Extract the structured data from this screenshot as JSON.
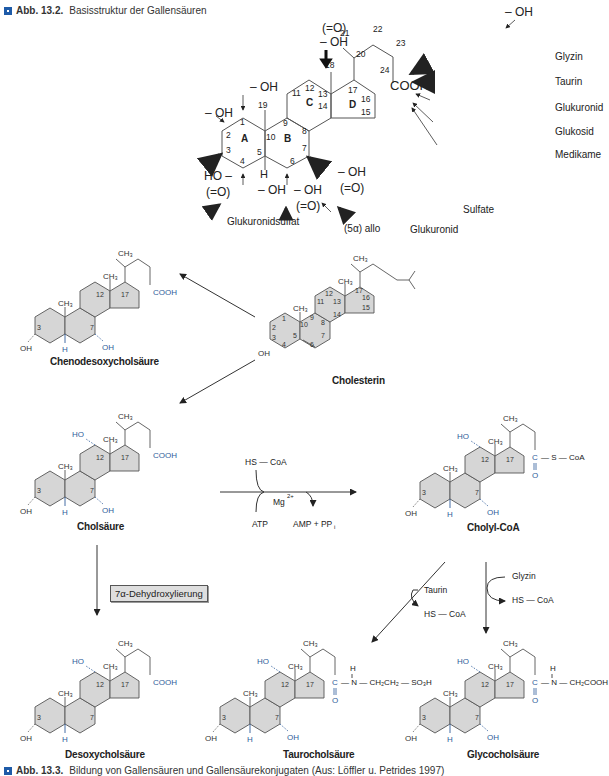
{
  "figure_top": {
    "caption_label": "Abb. 13.2.",
    "caption_text": "Basisstruktur der Gallensäuren",
    "ring_labels": [
      "A",
      "B",
      "C",
      "D"
    ],
    "atom_numbers": [
      "1",
      "2",
      "3",
      "4",
      "5",
      "6",
      "7",
      "8",
      "9",
      "10",
      "11",
      "12",
      "13",
      "14",
      "15",
      "16",
      "17",
      "18",
      "19",
      "20",
      "21",
      "22",
      "23",
      "24"
    ],
    "substituents": {
      "c1": "– OH",
      "c2": "– OH",
      "c3_oh": "HO –",
      "c3_oxo": "(=O)",
      "c4": "– OH",
      "c5_h": "H",
      "c6_oh": "– OH",
      "c6_oxo": "(=O)",
      "c7_oh": "– OH",
      "c7_oxo": "(=O)",
      "c12_oxo": "(=O)",
      "c12_oh": "– OH",
      "c23": "– OH",
      "cooh": "COOH"
    },
    "conjugates": [
      "Glyzin",
      "Taurin",
      "Glukuronid",
      "Glukosid",
      "Medikame"
    ],
    "annotations": {
      "glukuronidsulfat": "Glukuronidsulfat",
      "allo": "(5α) allo",
      "glukuronid": "Glukuronid",
      "sulfate": "Sulfate"
    }
  },
  "figure_bottom": {
    "compounds": {
      "chenodesoxycholsaeure": "Chenodesoxycholsäure",
      "cholesterin": "Cholesterin",
      "cholsaeure": "Cholsäure",
      "cholyl_coa": "Cholyl-CoA",
      "desoxycholsaeure": "Desoxycholsäure",
      "taurocholsaeure": "Taurocholsäure",
      "glycocholsaeure": "Glycocholsäure"
    },
    "reaction": {
      "hs_coa_in": "HS — CoA",
      "mg": "Mg",
      "mg_charge": "2+",
      "atp": "ATP",
      "amp_ppi": "AMP + PP",
      "ppi_sub": "i",
      "dehydroxylation": "7α-Dehydroxylierung",
      "taurin": "Taurin",
      "taurin_hscoa": "HS — CoA",
      "glyzin": "Glyzin",
      "glyzin_hscoa": "HS — CoA"
    },
    "groups": {
      "ch3": "CH",
      "oh": "OH",
      "ho": "HO",
      "h": "H",
      "cooh": "COOH",
      "s_coa": "S — CoA",
      "tauro_tail": "N — CH₂CH₂ — SO₃H",
      "glyco_tail": "N — CH₂COOH"
    },
    "caption_label": "Abb. 13.3.",
    "caption_text": "Bildung von Gallensäuren und Gallensäurekonjugaten (Aus: Löffler u. Petrides 1997)"
  },
  "colors": {
    "accent_blue": "#2f5c9a",
    "ring_fill": "#d6d6d6",
    "line": "#444444",
    "caption_square": "#1e5ba8"
  }
}
